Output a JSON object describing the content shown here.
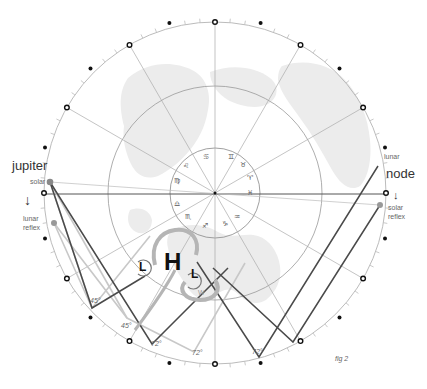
{
  "figure": {
    "caption": "fig 2",
    "colors": {
      "background": "#ffffff",
      "landmass": "#ebebeb",
      "circle_lines": "#999999",
      "radial_lines": "#aaaaaa",
      "dark_path": "#444444",
      "light_path": "#c4c4c4",
      "arrow_gray": "#b0b0b0",
      "marker_dark": "#111111"
    }
  },
  "labels": {
    "jupiter": "jupiter",
    "jupiter_solar": "solar",
    "jupiter_lunar_reflex_1": "lunar",
    "jupiter_lunar_reflex_2": "reflex",
    "node": "node",
    "node_lunar": "lunar",
    "node_solar_reflex_1": "solar",
    "node_solar_reflex_2": "reflex",
    "arrow_down": "↓"
  },
  "zodiac_signs": [
    {
      "name": "gemini",
      "glyph": "♊"
    },
    {
      "name": "taurus",
      "glyph": "♉"
    },
    {
      "name": "aries",
      "glyph": "♈"
    },
    {
      "name": "pisces",
      "glyph": "♓"
    },
    {
      "name": "aquarius",
      "glyph": "♒"
    },
    {
      "name": "capricorn",
      "glyph": "♑"
    },
    {
      "name": "sagittarius",
      "glyph": "♐"
    },
    {
      "name": "scorpio",
      "glyph": "♏"
    },
    {
      "name": "libra",
      "glyph": "♎"
    },
    {
      "name": "virgo",
      "glyph": "♍"
    },
    {
      "name": "leo",
      "glyph": "♌"
    },
    {
      "name": "cancer",
      "glyph": "♋"
    }
  ],
  "pressure_systems": {
    "high": "H",
    "low_1": "L",
    "low_2": "L",
    "wind_label": "W"
  },
  "angles": {
    "a1": "45°",
    "a2": "45°",
    "a3": "72°",
    "a4": "72°",
    "a5": "72°"
  }
}
